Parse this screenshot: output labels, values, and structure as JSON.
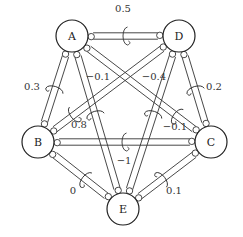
{
  "nodes": [
    {
      "id": "A",
      "label": "A",
      "x": 72,
      "y": 36
    },
    {
      "id": "D",
      "label": "D",
      "x": 179,
      "y": 36
    },
    {
      "id": "B",
      "label": "B",
      "x": 38,
      "y": 142
    },
    {
      "id": "C",
      "label": "C",
      "x": 211,
      "y": 142
    },
    {
      "id": "E",
      "label": "E",
      "x": 123,
      "y": 209
    }
  ],
  "node_radius": 16,
  "edges": [
    {
      "from": "A",
      "to": "D",
      "label": "0.5",
      "t": 0.5,
      "lx": 123,
      "ly": 12
    },
    {
      "from": "A",
      "to": "B",
      "label": "0.3",
      "t": 0.5,
      "lx": 32,
      "ly": 90
    },
    {
      "from": "D",
      "to": "C",
      "label": "0.2",
      "t": 0.5,
      "lx": 214,
      "ly": 90
    },
    {
      "from": "A",
      "to": "E",
      "label": "−0.1",
      "t": 0.45,
      "lx": 98,
      "ly": 80
    },
    {
      "from": "D",
      "to": "E",
      "label": "−0.4",
      "t": 0.45,
      "lx": 154,
      "ly": 80
    },
    {
      "from": "B",
      "to": "D",
      "label": "0.8",
      "t": 0.25,
      "lx": 79,
      "ly": 128
    },
    {
      "from": "A",
      "to": "C",
      "label": "−0.1",
      "t": 0.75,
      "lx": 175,
      "ly": 130
    },
    {
      "from": "B",
      "to": "C",
      "label": "−1",
      "t": 0.5,
      "lx": 124,
      "ly": 164
    },
    {
      "from": "B",
      "to": "E",
      "label": "0",
      "t": 0.55,
      "lx": 73,
      "ly": 194
    },
    {
      "from": "C",
      "to": "E",
      "label": "0.1",
      "t": 0.55,
      "lx": 174,
      "ly": 194
    }
  ]
}
